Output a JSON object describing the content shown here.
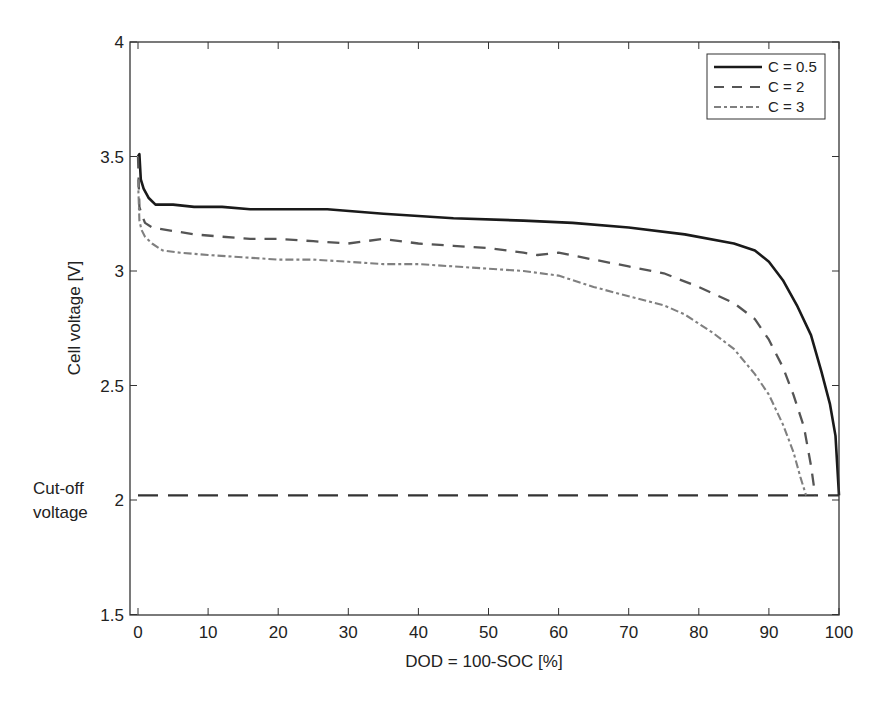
{
  "chart_data": {
    "type": "line",
    "title": "",
    "xlabel": "DOD = 100-SOC [%]",
    "ylabel": "Cell voltage [V]",
    "xlim": [
      -1,
      100
    ],
    "ylim": [
      1.5,
      4
    ],
    "xticks": [
      0,
      10,
      20,
      30,
      40,
      50,
      60,
      70,
      80,
      90,
      100
    ],
    "yticks": [
      1.5,
      2,
      2.5,
      3,
      3.5,
      4
    ],
    "ytick_labels": [
      "1.5",
      "2",
      "2.5",
      "3",
      "3.5",
      "4"
    ],
    "grid": false,
    "legend_position": "upper right",
    "annotations": [
      {
        "text_lines": [
          "Cut-off",
          "voltage"
        ],
        "x_side": "left-of-axis",
        "y": 2.0
      }
    ],
    "reference_lines": [
      {
        "name": "Cut-off voltage",
        "y": 2.02,
        "x_range": [
          0,
          100
        ],
        "style": "long-dash",
        "color": "#333333"
      }
    ],
    "series": [
      {
        "name": "C = 0.5",
        "style": "solid",
        "color": "#1a1a1a",
        "x": [
          0,
          0.2,
          0.4,
          0.8,
          1.5,
          2.5,
          5,
          8,
          12,
          16,
          20,
          27,
          35,
          45,
          55,
          62,
          70,
          78,
          85,
          88,
          90,
          92,
          94,
          96,
          97.5,
          98.7,
          99.5,
          100
        ],
        "y": [
          3.5,
          3.51,
          3.4,
          3.36,
          3.32,
          3.29,
          3.29,
          3.28,
          3.28,
          3.27,
          3.27,
          3.27,
          3.25,
          3.23,
          3.22,
          3.21,
          3.19,
          3.16,
          3.12,
          3.09,
          3.04,
          2.96,
          2.85,
          2.72,
          2.56,
          2.42,
          2.28,
          2.02
        ]
      },
      {
        "name": "C = 2",
        "style": "dashed",
        "color": "#555555",
        "x": [
          0,
          0.2,
          0.5,
          1,
          2,
          4,
          8,
          12,
          16,
          20,
          25,
          30,
          35,
          40,
          45,
          50,
          55,
          57,
          60,
          65,
          70,
          75,
          80,
          85,
          88,
          90,
          92,
          93.5,
          95,
          96,
          96.6
        ],
        "y": [
          3.5,
          3.28,
          3.25,
          3.21,
          3.19,
          3.18,
          3.16,
          3.15,
          3.14,
          3.14,
          3.13,
          3.12,
          3.14,
          3.12,
          3.11,
          3.1,
          3.08,
          3.07,
          3.08,
          3.05,
          3.02,
          2.99,
          2.93,
          2.86,
          2.79,
          2.7,
          2.58,
          2.46,
          2.32,
          2.15,
          2.02
        ]
      },
      {
        "name": "C = 3",
        "style": "dash-dot",
        "color": "#808080",
        "x": [
          0,
          0.2,
          0.5,
          1,
          2,
          3.5,
          6,
          10,
          15,
          20,
          25,
          30,
          35,
          40,
          45,
          50,
          55,
          60,
          65,
          70,
          75,
          78,
          82,
          85,
          88,
          90,
          92,
          93.5,
          94.5,
          95.3
        ],
        "y": [
          3.4,
          3.22,
          3.18,
          3.15,
          3.12,
          3.09,
          3.08,
          3.07,
          3.06,
          3.05,
          3.05,
          3.04,
          3.03,
          3.03,
          3.02,
          3.01,
          3.0,
          2.98,
          2.93,
          2.89,
          2.85,
          2.81,
          2.73,
          2.66,
          2.55,
          2.46,
          2.33,
          2.21,
          2.1,
          2.02
        ]
      }
    ]
  },
  "axes": {
    "xlabel": "DOD = 100-SOC [%]",
    "ylabel": "Cell voltage [V]",
    "annotation_line1": "Cut-off",
    "annotation_line2": "voltage"
  },
  "legend": {
    "items": [
      {
        "label": "C = 0.5"
      },
      {
        "label": "C = 2"
      },
      {
        "label": "C = 3"
      }
    ]
  }
}
